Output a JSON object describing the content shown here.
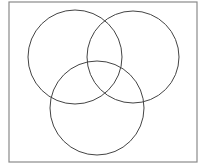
{
  "diagram": {
    "type": "venn",
    "set_count": 3,
    "labels": [],
    "border": {
      "x": 9,
      "y": 2,
      "width": 188,
      "height": 160,
      "color": "#8a8a8a",
      "stroke_width": 1.2
    },
    "circles": [
      {
        "name": "left",
        "cx": 75,
        "cy": 57,
        "r": 47,
        "color": "#444444"
      },
      {
        "name": "right",
        "cx": 133,
        "cy": 57,
        "r": 46,
        "color": "#444444"
      },
      {
        "name": "bottom",
        "cx": 97,
        "cy": 108,
        "r": 47,
        "color": "#444444"
      }
    ]
  }
}
